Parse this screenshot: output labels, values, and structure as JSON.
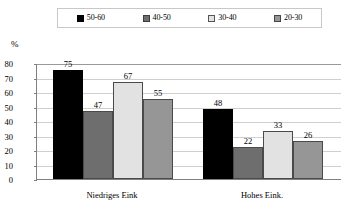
{
  "chart_data": {
    "type": "bar",
    "title": "",
    "xlabel": "",
    "ylabel": "%",
    "ylim": [
      0,
      80
    ],
    "yticks": [
      0,
      10,
      20,
      30,
      40,
      50,
      60,
      70,
      80
    ],
    "grid": true,
    "legend_position": "top",
    "categories": [
      "Niedriges Eink",
      "Hohes Eink."
    ],
    "series": [
      {
        "name": "50-60",
        "color": "#000000",
        "values": [
          75,
          48
        ]
      },
      {
        "name": "40-50",
        "color": "#6e6e6e",
        "values": [
          47,
          22
        ]
      },
      {
        "name": "30-40",
        "color": "#e2e2e2",
        "values": [
          67,
          33
        ]
      },
      {
        "name": "20-30",
        "color": "#969696",
        "values": [
          55,
          26
        ]
      }
    ]
  },
  "legend": {
    "entries": [
      {
        "label": "50-60",
        "swatch": "legend-swatch-50-60"
      },
      {
        "label": "40-50",
        "swatch": "legend-swatch-40-50"
      },
      {
        "label": "30-40",
        "swatch": "legend-swatch-30-40"
      },
      {
        "label": "20-30",
        "swatch": "legend-swatch-20-30"
      }
    ]
  },
  "axis": {
    "y_unit_label": "%",
    "y_tick_labels": [
      "80",
      "70",
      "60",
      "50",
      "40",
      "30",
      "20",
      "10",
      "0"
    ]
  },
  "category_labels": [
    "Niedriges Eink",
    "Hohes Eink."
  ],
  "value_labels_group1": [
    "75",
    "47",
    "67",
    "55"
  ],
  "value_labels_group2": [
    "48",
    "22",
    "33",
    "26"
  ],
  "colors": {
    "series_50_60": "#000000",
    "series_40_50": "#6e6e6e",
    "series_30_40": "#e2e2e2",
    "series_20_30": "#969696",
    "gridline": "#cfcfcf",
    "axis": "#808080",
    "legend_border": "#c8c8c8"
  }
}
